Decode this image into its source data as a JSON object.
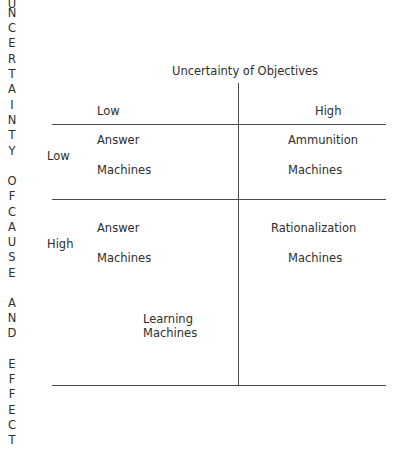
{
  "side_label": {
    "letters": [
      "U",
      "N",
      "C",
      "E",
      "R",
      "T",
      "A",
      "I",
      "N",
      "T",
      "Y",
      " ",
      "O",
      "F",
      " ",
      "C",
      "A",
      "U",
      "S",
      "E",
      " ",
      "A",
      "N",
      "D",
      " ",
      "E",
      "F",
      "F",
      "E",
      "C",
      "T"
    ],
    "text": "UNCERTAINTY OF CAUSE AND EFFECT"
  },
  "column_axis": {
    "title": "Uncertainty of Objectives",
    "low": "Low",
    "high": "High"
  },
  "row_axis": {
    "low": "Low",
    "high": "High"
  },
  "cells": {
    "low_low": [
      "Answer",
      "Machines"
    ],
    "low_high": [
      "Ammunition",
      "Machines"
    ],
    "high_low": [
      "Answer",
      "Machines"
    ],
    "high_high": [
      "Rationalization",
      "Machines"
    ],
    "high_low_extra": [
      "Learning",
      "Machines"
    ]
  }
}
